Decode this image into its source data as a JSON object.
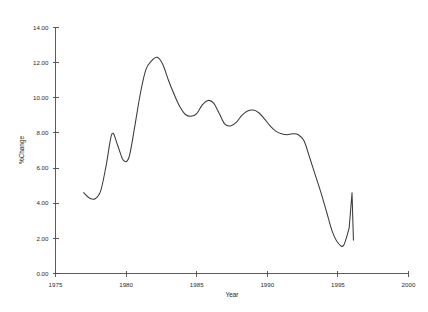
{
  "chart_data": {
    "type": "line",
    "title": "",
    "xlabel": "Year",
    "ylabel": "%Change",
    "xlim": [
      1975,
      2000
    ],
    "ylim": [
      0,
      14
    ],
    "xticks": [
      1975,
      1980,
      1985,
      1990,
      1995,
      2000
    ],
    "xtick_labels": [
      "1975",
      "1980",
      "1985",
      "1990",
      "1995",
      "2000"
    ],
    "yticks": [
      0,
      2,
      4,
      6,
      8,
      10,
      12,
      14
    ],
    "ytick_labels": [
      "0.00",
      "2.00",
      "4.00",
      "6.00",
      "8.00",
      "10.00",
      "12.00",
      "14.00"
    ],
    "grid": false,
    "legend": false,
    "line_color": "#3a3a3a",
    "series": [
      {
        "name": "%Change",
        "x": [
          1977.0,
          1977.4,
          1977.8,
          1978.2,
          1978.6,
          1979.0,
          1979.4,
          1979.8,
          1980.2,
          1980.6,
          1981.0,
          1981.4,
          1981.8,
          1982.2,
          1982.6,
          1983.0,
          1983.4,
          1983.8,
          1984.2,
          1984.6,
          1985.0,
          1985.4,
          1985.8,
          1986.2,
          1986.6,
          1987.0,
          1987.4,
          1987.8,
          1988.2,
          1988.6,
          1989.0,
          1989.4,
          1989.8,
          1990.2,
          1990.6,
          1991.0,
          1991.4,
          1991.8,
          1992.2,
          1992.6,
          1993.0,
          1993.4,
          1993.8,
          1994.2,
          1994.6,
          1995.0,
          1995.4,
          1995.8,
          1996.0,
          1996.1
        ],
        "y": [
          4.6,
          4.3,
          4.25,
          4.7,
          6.2,
          7.95,
          7.3,
          6.45,
          6.6,
          8.3,
          10.2,
          11.6,
          12.1,
          12.3,
          11.9,
          11.0,
          10.2,
          9.5,
          9.05,
          8.95,
          9.1,
          9.6,
          9.85,
          9.7,
          9.1,
          8.5,
          8.4,
          8.6,
          9.0,
          9.25,
          9.3,
          9.15,
          8.8,
          8.4,
          8.1,
          7.95,
          7.9,
          7.95,
          7.9,
          7.55,
          6.6,
          5.6,
          4.6,
          3.5,
          2.4,
          1.75,
          1.6,
          2.6,
          4.6,
          1.9
        ]
      }
    ]
  },
  "axes": {
    "x_title": "Year",
    "y_title": "%Change"
  }
}
